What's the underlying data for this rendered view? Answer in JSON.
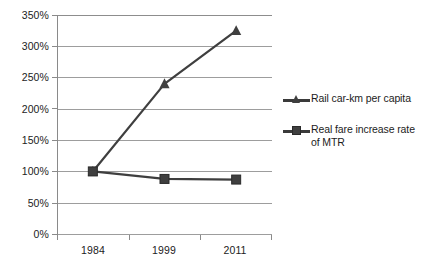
{
  "chart_data": {
    "type": "line",
    "title": "",
    "subtitle": "",
    "xlabel": "",
    "ylabel": "",
    "categories": [
      "1984",
      "1999",
      "2011"
    ],
    "ylim": [
      0,
      350
    ],
    "ytick_values": [
      0,
      50,
      100,
      150,
      200,
      250,
      300,
      350
    ],
    "ytick_labels": [
      "0%",
      "50%",
      "100%",
      "150%",
      "200%",
      "250%",
      "300%",
      "350%"
    ],
    "grid": true,
    "legend_position": "right",
    "series": [
      {
        "name": "Rail car-km per capita",
        "marker": "triangle",
        "color": "#3f3f3f",
        "values": [
          100,
          240,
          325
        ]
      },
      {
        "name": "Real fare increase rate of MTR",
        "marker": "square",
        "color": "#3f3f3f",
        "values": [
          100,
          88,
          87
        ]
      }
    ]
  },
  "axis": {
    "y_labels": [
      "350%",
      "300%",
      "250%",
      "200%",
      "150%",
      "100%",
      "50%",
      "0%"
    ],
    "x_labels": [
      "1984",
      "1999",
      "2011"
    ]
  },
  "legend": {
    "entries": [
      {
        "label": "Rail car-km per capita",
        "marker": "triangle-marker-icon"
      },
      {
        "label": "Real fare increase rate of MTR",
        "marker": "square-marker-icon"
      }
    ]
  },
  "colors": {
    "series": "#3f3f3f",
    "grid": "#9d9d9d",
    "axis": "#8a8a8a",
    "text": "#1c1c1c",
    "background": "#ffffff"
  }
}
